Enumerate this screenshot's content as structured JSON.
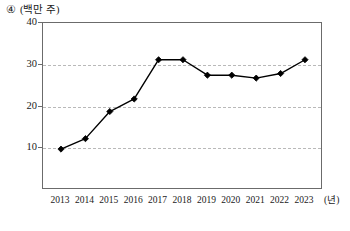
{
  "caption": {
    "marker": "④",
    "unit": "(백만 주)"
  },
  "axis": {
    "x_unit": "(년)",
    "y_ticks": [
      "40",
      "30",
      "20",
      "10"
    ],
    "x_ticks": [
      "2013",
      "2014",
      "2015",
      "2016",
      "2017",
      "2018",
      "2019",
      "2020",
      "2021",
      "2022",
      "2023"
    ]
  },
  "chart_data": {
    "type": "line",
    "title": "",
    "subtitle": "",
    "xlabel": "(년)",
    "ylabel": "(백만 주)",
    "categories": [
      "2013",
      "2014",
      "2015",
      "2016",
      "2017",
      "2018",
      "2019",
      "2020",
      "2021",
      "2022",
      "2023"
    ],
    "values": [
      9.8,
      12.3,
      18.8,
      21.8,
      31.2,
      31.2,
      27.5,
      27.5,
      26.8,
      27.9,
      31.2
    ],
    "series": [
      {
        "name": "주식 수",
        "values": [
          9.8,
          12.3,
          18.8,
          21.8,
          31.2,
          31.2,
          27.5,
          27.5,
          26.8,
          27.9,
          31.2
        ]
      }
    ],
    "ylim": [
      0,
      40
    ],
    "y_ticks": [
      10,
      20,
      30,
      40
    ],
    "grid": "horizontal-dashed",
    "legend": "none",
    "marker": "filled-diamond",
    "line_color": "#000000",
    "grid_color": "#b9b9b9",
    "axis_color": "#6b6b6b"
  }
}
